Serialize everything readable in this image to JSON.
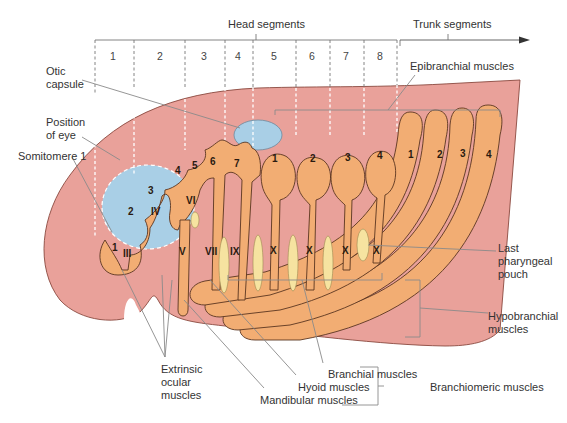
{
  "title_labels": {
    "head_segments": "Head segments",
    "trunk_segments": "Trunk segments"
  },
  "segment_numbers": [
    "1",
    "2",
    "3",
    "4",
    "5",
    "6",
    "7",
    "8"
  ],
  "labels": {
    "otic_capsule_1": "Otic",
    "otic_capsule_2": "capsule",
    "position_of_eye_1": "Position",
    "position_of_eye_2": "of eye",
    "somitomere_1": "Somitomere 1",
    "epibranchial": "Epibranchial muscles",
    "last_pharyngeal_1": "Last",
    "last_pharyngeal_2": "pharyngeal",
    "last_pharyngeal_3": "pouch",
    "hypobranchial_1": "Hypobranchial",
    "hypobranchial_2": "muscles",
    "extrinsic_1": "Extrinsic",
    "extrinsic_2": "ocular",
    "extrinsic_3": "muscles",
    "branchial_muscles": "Branchial muscles",
    "hyoid_muscles": "Hyoid muscles",
    "mandibular_muscles": "Mandibular muscles",
    "branchiomeric_muscles": "Branchiomeric muscles"
  },
  "somitomeres": [
    "1",
    "2",
    "3",
    "4",
    "5",
    "6",
    "7"
  ],
  "occipital_somites": [
    "1",
    "2",
    "3",
    "4"
  ],
  "trunk_somites": [
    "1",
    "2",
    "3",
    "4"
  ],
  "cranial_nerves": {
    "III": "III",
    "IV": "IV",
    "V": "V",
    "VI": "VI",
    "VII": "VII",
    "IX": "IX",
    "X": [
      "X",
      "X",
      "X",
      "X"
    ]
  },
  "colors": {
    "body": "#e9a19a",
    "muscle": "#f2ad73",
    "eye_otic": "#a9cfe6",
    "pouch": "#f6e3a0"
  }
}
